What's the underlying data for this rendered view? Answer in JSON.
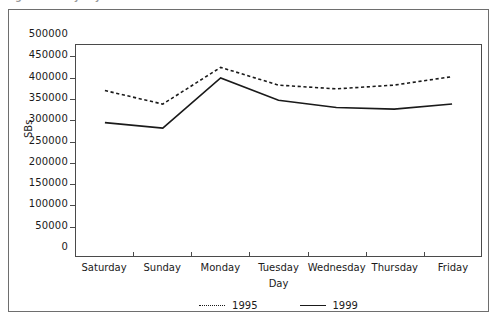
{
  "figure": {
    "title_sliver": "Figure: SBs by day of week",
    "plot_left": 66,
    "plot_top": 34,
    "plot_width": 407,
    "plot_height": 213
  },
  "chart_data": {
    "type": "line",
    "title": "",
    "xlabel": "Day",
    "ylabel": "SBs",
    "categories": [
      "Saturday",
      "Sunday",
      "Monday",
      "Tuesday",
      "Wednesday",
      "Thursday",
      "Friday"
    ],
    "series": [
      {
        "name": "1995",
        "style": "dotted",
        "color": "#1a1a1a",
        "values": [
          392000,
          360000,
          447000,
          405000,
          396000,
          405000,
          425000
        ]
      },
      {
        "name": "1999",
        "style": "solid",
        "color": "#1a1a1a",
        "values": [
          316000,
          303000,
          422000,
          369000,
          352000,
          348000,
          360000
        ]
      }
    ],
    "ylim": [
      0,
      500000
    ],
    "ytick_values": [
      0,
      50000,
      100000,
      150000,
      200000,
      250000,
      300000,
      350000,
      400000,
      450000,
      500000
    ],
    "ytick_labels": [
      "0",
      "50000",
      "100000",
      "150000",
      "200000",
      "250000",
      "300000",
      "350000",
      "400000",
      "450000",
      "500000"
    ],
    "grid": false,
    "legend_position": "bottom-center"
  }
}
